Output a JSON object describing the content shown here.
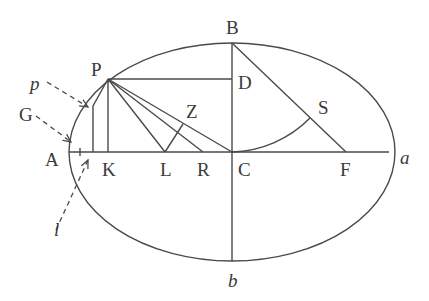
{
  "diagram": {
    "ellipse": {
      "cx": 232,
      "cy": 152,
      "rx": 163,
      "ry": 109
    },
    "points": {
      "P": [
        108,
        79
      ],
      "D": [
        232,
        79
      ],
      "B": [
        232,
        43
      ],
      "C": [
        232,
        152
      ],
      "b": [
        232,
        261
      ],
      "A": [
        69,
        152
      ],
      "a": [
        395,
        152
      ],
      "K": [
        108,
        152
      ],
      "L": [
        165,
        152
      ],
      "R": [
        203,
        152
      ],
      "F": [
        346,
        152
      ],
      "S": [
        310,
        118
      ],
      "Z": [
        182,
        124
      ],
      "p_foot": [
        92,
        104
      ]
    },
    "labels": [
      {
        "id": "P",
        "text": "P",
        "x": 91,
        "y": 76,
        "italic": false
      },
      {
        "id": "B",
        "text": "B",
        "x": 226,
        "y": 34,
        "italic": false
      },
      {
        "id": "D",
        "text": "D",
        "x": 238,
        "y": 89,
        "italic": false
      },
      {
        "id": "Z",
        "text": "Z",
        "x": 186,
        "y": 118,
        "italic": false
      },
      {
        "id": "S",
        "text": "S",
        "x": 318,
        "y": 114,
        "italic": false
      },
      {
        "id": "A",
        "text": "A",
        "x": 45,
        "y": 166,
        "italic": false
      },
      {
        "id": "K",
        "text": "K",
        "x": 102,
        "y": 176,
        "italic": false
      },
      {
        "id": "L",
        "text": "L",
        "x": 160,
        "y": 176,
        "italic": false
      },
      {
        "id": "R",
        "text": "R",
        "x": 197,
        "y": 176,
        "italic": false
      },
      {
        "id": "C",
        "text": "C",
        "x": 238,
        "y": 176,
        "italic": false
      },
      {
        "id": "F",
        "text": "F",
        "x": 340,
        "y": 176,
        "italic": false
      },
      {
        "id": "a",
        "text": "a",
        "x": 400,
        "y": 164,
        "italic": true
      },
      {
        "id": "b",
        "text": "b",
        "x": 228,
        "y": 287,
        "italic": true
      },
      {
        "id": "p",
        "text": "p",
        "x": 30,
        "y": 90,
        "italic": true
      },
      {
        "id": "G",
        "text": "G",
        "x": 19,
        "y": 121,
        "italic": false
      },
      {
        "id": "l",
        "text": "l",
        "x": 54,
        "y": 236,
        "italic": true
      }
    ],
    "colors": {
      "stroke": "#4a4a4a",
      "label": "#3a3a3a",
      "background": "#ffffff"
    }
  }
}
